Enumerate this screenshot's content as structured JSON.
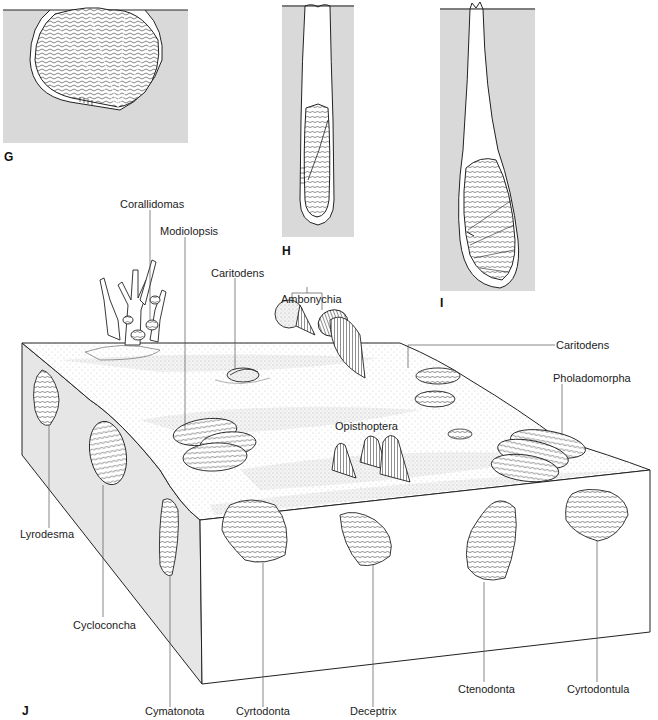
{
  "figure": {
    "panels": [
      {
        "id": "G",
        "label": "G",
        "description": "bivalve shell nestled in shallow sediment depression"
      },
      {
        "id": "H",
        "label": "H",
        "description": "elongate bivalve in deep narrow vertical burrow"
      },
      {
        "id": "I",
        "label": "I",
        "description": "bivalve at base of deep club-shaped boring"
      },
      {
        "id": "J",
        "label": "J",
        "description": "block diagram of seafloor with epifaunal and infaunal bivalves"
      }
    ],
    "taxa_labels": {
      "corallidomas": "Corallidomas",
      "modiolopsis": "Modiolopsis",
      "caritodens_top": "Caritodens",
      "ambonychia": "Ambonychia",
      "caritodens_right": "Caritodens",
      "pholadomorpha": "Pholadomorpha",
      "opisthoptera": "Opisthoptera",
      "lyrodesma": "Lyrodesma",
      "cycloconcha": "Cycloconcha",
      "cymatonota": "Cymatonota",
      "cyrtodonta": "Cyrtodonta",
      "deceptrix": "Deceptrix",
      "ctenodonta": "Ctenodonta",
      "cyrtodontula": "Cyrtodontula"
    },
    "colors": {
      "sediment_fill": "#d9d9d9",
      "line": "#1a1a1a",
      "leader_line": "#555555",
      "shell_fill": "#ffffff",
      "block_side_shade": "#e4e4e4"
    }
  }
}
